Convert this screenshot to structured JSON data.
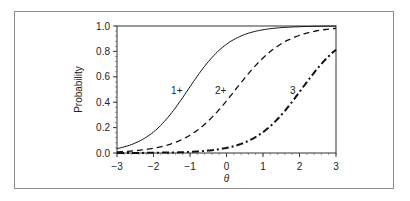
{
  "chart_data": {
    "type": "line",
    "title": "",
    "xlabel": "θ",
    "ylabel": "Probability",
    "xlim": [
      -3,
      3
    ],
    "ylim": [
      0.0,
      1.0
    ],
    "xticks": [
      "-3",
      "-2",
      "-1",
      "0",
      "1",
      "2",
      "3"
    ],
    "yticks": [
      "0.0",
      "0.2",
      "0.4",
      "0.6",
      "0.8",
      "1.0"
    ],
    "grid": false,
    "legend": "inline labels",
    "series": [
      {
        "name": "1+",
        "style": "solid",
        "x": [
          -3,
          -2.5,
          -2,
          -1.5,
          -1,
          -0.5,
          0,
          0.5,
          1,
          1.5,
          2,
          2.5,
          3
        ],
        "values": [
          0.03,
          0.06,
          0.12,
          0.26,
          0.48,
          0.7,
          0.86,
          0.94,
          0.975,
          0.99,
          0.995,
          0.998,
          0.999
        ]
      },
      {
        "name": "2+",
        "style": "dashed",
        "x": [
          -3,
          -2.5,
          -2,
          -1.5,
          -1,
          -0.5,
          0,
          0.5,
          1,
          1.5,
          2,
          2.5,
          3
        ],
        "values": [
          0.01,
          0.02,
          0.04,
          0.07,
          0.13,
          0.24,
          0.42,
          0.62,
          0.79,
          0.89,
          0.95,
          0.98,
          0.99
        ]
      },
      {
        "name": "3",
        "style": "dash-dot",
        "x": [
          -3,
          -2.5,
          -2,
          -1.5,
          -1,
          -0.5,
          0,
          0.5,
          1,
          1.5,
          2,
          2.5,
          3
        ],
        "values": [
          0.0,
          0.0,
          0.005,
          0.01,
          0.015,
          0.02,
          0.04,
          0.07,
          0.14,
          0.27,
          0.45,
          0.66,
          0.84
        ]
      }
    ],
    "annotations": [
      {
        "text": "1+",
        "x": -1.15,
        "y": 0.5
      },
      {
        "text": "2+",
        "x": 0.05,
        "y": 0.5
      },
      {
        "text": "3",
        "x": 1.95,
        "y": 0.5
      }
    ]
  }
}
